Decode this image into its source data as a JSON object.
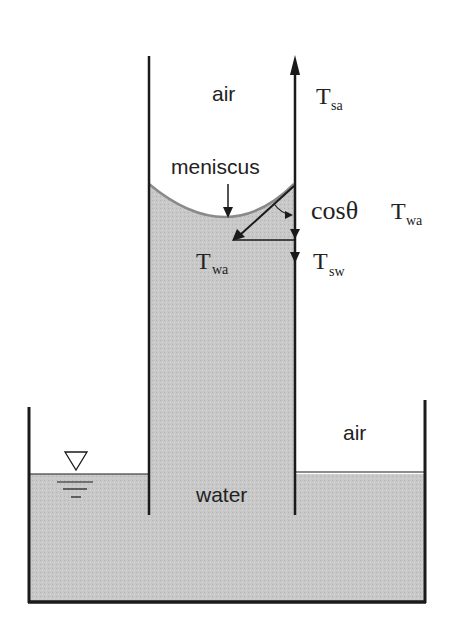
{
  "diagram": {
    "labels": {
      "air_tube": "air",
      "air_tank": "air",
      "meniscus": "meniscus",
      "water": "water",
      "cos_theta": "cosθ",
      "T_main": "T",
      "sub_sa": "sa",
      "sub_wa_cos": "wa",
      "sub_wa": "wa",
      "sub_sw": "sw"
    },
    "colors": {
      "water_fill": "#c9c9c9",
      "line": "#1a1a1a",
      "meniscus_edge": "#8a8a8a",
      "background": "#ffffff"
    },
    "symbols": {
      "free_surface": "inverted-triangle-water-level"
    }
  }
}
